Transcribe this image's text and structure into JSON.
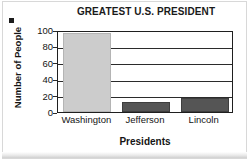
{
  "chart_data": {
    "type": "bar",
    "title": "GREATEST U.S. PRESIDENT",
    "xlabel": "Presidents",
    "ylabel": "Number of People",
    "categories": [
      "Washington",
      "Jefferson",
      "Lincoln"
    ],
    "values": [
      96,
      12,
      17
    ],
    "bar_colors": [
      "#cccccc",
      "#555555",
      "#555555"
    ],
    "ylim": [
      0,
      100
    ],
    "yticks": [
      100,
      80,
      60,
      40,
      20,
      0
    ],
    "ytick_labels": [
      "100",
      "80",
      "60",
      "40",
      "20",
      "0"
    ],
    "grid": true,
    "legend": "none",
    "frame_color": "#1f1f1f"
  }
}
